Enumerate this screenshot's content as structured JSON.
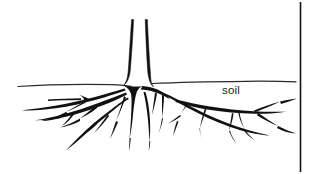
{
  "figure": {
    "type": "line-drawing",
    "background_color": "#ffffff",
    "ink_color": "#111111",
    "labels": {
      "soil": "soil"
    },
    "annotations": {
      "flow_arrow": {
        "name": "rightward-arrow",
        "direction": "right",
        "x_start": 48,
        "x_end": 88,
        "y": 99
      }
    },
    "elements": {
      "trunk": "two near-vertical tapering lines rising from ground line",
      "ground_line": "undulating horizontal soil surface line",
      "roots": "branching lateral and tap roots spreading below the soil line",
      "border_rule": "vertical black rule near right edge"
    },
    "geometry": {
      "width": 309,
      "height": 174,
      "ground_line_y": 85,
      "trunk_top_y": 19,
      "deepest_root_y": 152,
      "border_rule_x": 300
    }
  }
}
